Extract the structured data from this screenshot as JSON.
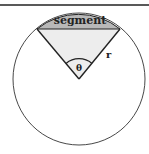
{
  "diagram": {
    "labels": {
      "segment": "segment",
      "radius": "r",
      "angle": "θ"
    },
    "colors": {
      "segment_fill": "#b8b8b8",
      "sector_fill": "#ededed",
      "stroke": "#222222",
      "background": "#ffffff"
    }
  }
}
